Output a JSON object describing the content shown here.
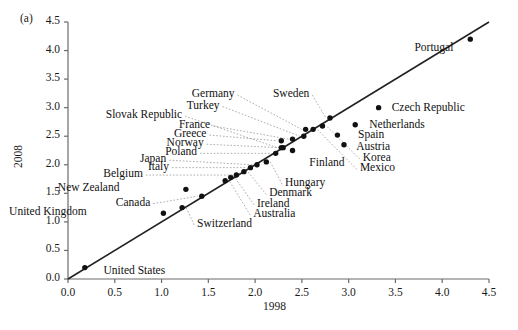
{
  "figure": {
    "panel_label": "(a)",
    "xlabel": "1998",
    "ylabel": "2008"
  },
  "chart_data": {
    "type": "scatter",
    "title": "",
    "xlabel": "1998",
    "ylabel": "2008",
    "xlim": [
      0.0,
      4.5
    ],
    "ylim": [
      0.0,
      4.5
    ],
    "xticks": [
      "0.0",
      "0.5",
      "1.0",
      "1.5",
      "2.0",
      "2.5",
      "3.0",
      "3.5",
      "4.0",
      "4.5"
    ],
    "yticks": [
      "0.0",
      "0.5",
      "1.0",
      "1.5",
      "2.0",
      "2.5",
      "3.0",
      "3.5",
      "4.0",
      "4.5"
    ],
    "grid": false,
    "legend": null,
    "reference_line": {
      "type": "line",
      "description": "45-degree identity line",
      "x": [
        0.0,
        4.5
      ],
      "y": [
        0.0,
        4.5
      ]
    },
    "points": [
      {
        "name": "United States",
        "x": 0.18,
        "y": 0.2,
        "label_x": 0.38,
        "label_y": 0.12,
        "leader": false
      },
      {
        "name": "United Kingdom",
        "x": 1.02,
        "y": 1.15,
        "label_x": 0.2,
        "label_y": 1.15,
        "leader": false
      },
      {
        "name": "Switzerland",
        "x": 1.22,
        "y": 1.25,
        "label_x": 1.38,
        "label_y": 0.95,
        "leader": true
      },
      {
        "name": "Canada",
        "x": 1.43,
        "y": 1.45,
        "label_x": 0.88,
        "label_y": 1.32,
        "leader": true
      },
      {
        "name": "New Zealand",
        "x": 1.26,
        "y": 1.57,
        "label_x": 0.55,
        "label_y": 1.57,
        "leader": false
      },
      {
        "name": "Australia",
        "x": 1.68,
        "y": 1.72,
        "label_x": 1.98,
        "label_y": 1.12,
        "leader": true
      },
      {
        "name": "Ireland",
        "x": 1.74,
        "y": 1.78,
        "label_x": 2.02,
        "label_y": 1.3,
        "leader": true
      },
      {
        "name": "Belgium",
        "x": 1.8,
        "y": 1.82,
        "label_x": 0.8,
        "label_y": 1.82,
        "leader": true
      },
      {
        "name": "Denmark",
        "x": 1.88,
        "y": 1.88,
        "label_x": 2.15,
        "label_y": 1.48,
        "leader": true
      },
      {
        "name": "Italy",
        "x": 1.95,
        "y": 1.95,
        "label_x": 1.08,
        "label_y": 1.95,
        "leader": true
      },
      {
        "name": "Japan",
        "x": 2.02,
        "y": 2.0,
        "label_x": 1.05,
        "label_y": 2.08,
        "leader": true
      },
      {
        "name": "Hungary",
        "x": 2.12,
        "y": 2.05,
        "label_x": 2.32,
        "label_y": 1.66,
        "leader": true
      },
      {
        "name": "Poland",
        "x": 2.22,
        "y": 2.2,
        "label_x": 1.38,
        "label_y": 2.2,
        "leader": true
      },
      {
        "name": "Norway",
        "x": 2.3,
        "y": 2.3,
        "label_x": 1.45,
        "label_y": 2.36,
        "leader": true
      },
      {
        "name": "Greece",
        "x": 2.28,
        "y": 2.42,
        "label_x": 1.48,
        "label_y": 2.52,
        "leader": true
      },
      {
        "name": "France",
        "x": 2.4,
        "y": 2.45,
        "label_x": 1.52,
        "label_y": 2.68,
        "leader": true
      },
      {
        "name": "Finland",
        "x": 2.4,
        "y": 2.25,
        "label_x": 2.58,
        "label_y": 2.02,
        "leader": false
      },
      {
        "name": "Slovak Republic",
        "x": 2.28,
        "y": 2.3,
        "label_x": 1.22,
        "label_y": 2.85,
        "leader": true
      },
      {
        "name": "Turkey",
        "x": 2.52,
        "y": 2.5,
        "label_x": 1.62,
        "label_y": 3.02,
        "leader": true
      },
      {
        "name": "Germany",
        "x": 2.54,
        "y": 2.62,
        "label_x": 1.78,
        "label_y": 3.22,
        "leader": true
      },
      {
        "name": "Sweden",
        "x": 2.8,
        "y": 2.82,
        "label_x": 2.58,
        "label_y": 3.22,
        "leader": true
      },
      {
        "name": "Mexico",
        "x": 2.62,
        "y": 2.62,
        "label_x": 3.12,
        "label_y": 1.92,
        "leader": true
      },
      {
        "name": "Korea",
        "x": 2.72,
        "y": 2.68,
        "label_x": 3.15,
        "label_y": 2.1,
        "leader": true
      },
      {
        "name": "Austria",
        "x": 2.95,
        "y": 2.35,
        "label_x": 3.08,
        "label_y": 2.3,
        "leader": false
      },
      {
        "name": "Spain",
        "x": 2.88,
        "y": 2.52,
        "label_x": 3.1,
        "label_y": 2.5,
        "leader": false
      },
      {
        "name": "Netherlands",
        "x": 3.07,
        "y": 2.7,
        "label_x": 3.22,
        "label_y": 2.68,
        "leader": false
      },
      {
        "name": "Czech Republic",
        "x": 3.32,
        "y": 3.0,
        "label_x": 3.46,
        "label_y": 2.98,
        "leader": false
      },
      {
        "name": "Portugal",
        "x": 4.3,
        "y": 4.2,
        "label_x": 4.12,
        "label_y": 4.02,
        "leader": false
      }
    ]
  }
}
